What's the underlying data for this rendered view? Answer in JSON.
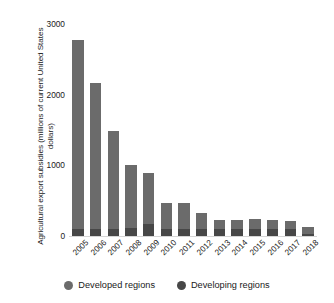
{
  "chart_data": {
    "type": "bar",
    "stacked": true,
    "title": "",
    "xlabel": "",
    "ylabel": "Agricultural export subsidies (millions of current United States dollars)",
    "categories": [
      "2005",
      "2006",
      "2007",
      "2008",
      "2009",
      "2010",
      "2011",
      "2012",
      "2013",
      "2014",
      "2015",
      "2016",
      "2017",
      "2018"
    ],
    "series": [
      {
        "name": "Developed regions",
        "color": "#6b6b6b",
        "values": [
          2665,
          2055,
          1385,
          900,
          715,
          370,
          365,
          230,
          125,
          120,
          130,
          120,
          110,
          100
        ]
      },
      {
        "name": "Developing regions",
        "color": "#474747",
        "values": [
          105,
          105,
          105,
          110,
          175,
          100,
          105,
          100,
          100,
          105,
          105,
          100,
          100,
          30
        ]
      }
    ],
    "totals": [
      2770,
      2160,
      1490,
      1010,
      890,
      470,
      470,
      330,
      225,
      225,
      235,
      220,
      210,
      130
    ],
    "yticks": [
      0,
      1000,
      2000,
      3000
    ],
    "ylim": [
      0,
      3000
    ],
    "grid": false,
    "legend_position": "bottom"
  },
  "legend": {
    "items": [
      {
        "label": "Developed regions",
        "color": "#6b6b6b",
        "marker": "circle-marker"
      },
      {
        "label": "Developing regions",
        "color": "#474747",
        "marker": "circle-marker"
      }
    ]
  }
}
